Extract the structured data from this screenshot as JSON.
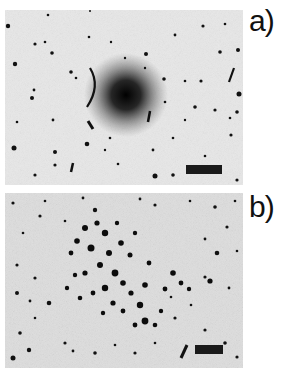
{
  "figure": {
    "panels": [
      {
        "label": "a)",
        "description": "diffuse concentrated stellar cluster with scale bar",
        "background": "#e6e6e6",
        "scale_bar_color": "#1a1a1a"
      },
      {
        "label": "b)",
        "description": "resolved clumpy stellar cluster with scale bar",
        "background": "#dcdcdc",
        "scale_bar_color": "#1a1a1a"
      }
    ]
  }
}
